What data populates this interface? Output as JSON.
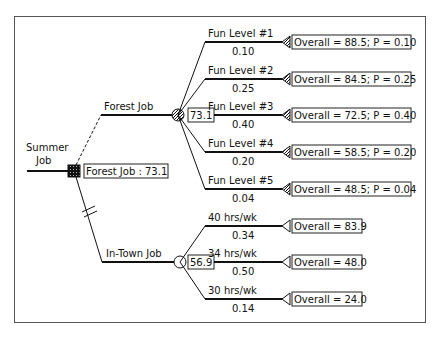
{
  "root": {
    "label_line1": "Summer",
    "label_line2": "Job",
    "value_label": "Forest Job : 73.1"
  },
  "decision_branches": [
    {
      "label": "Forest Job",
      "node_value": "73.1",
      "node_type": "chance"
    },
    {
      "label": "In-Town Job",
      "node_value": "56.9",
      "node_type": "chance"
    }
  ],
  "forest_outcomes": [
    {
      "label": "Fun Level #1",
      "prob": "0.10",
      "result": "Overall = 88.5; P = 0.10"
    },
    {
      "label": "Fun Level #2",
      "prob": "0.25",
      "result": "Overall = 84.5; P = 0.25"
    },
    {
      "label": "Fun Level #3",
      "prob": "0.40",
      "result": "Overall = 72.5; P = 0.40"
    },
    {
      "label": "Fun Level #4",
      "prob": "0.20",
      "result": "Overall = 58.5; P = 0.20"
    },
    {
      "label": "Fun Level #5",
      "prob": "0.04",
      "result": "Overall = 48.5; P = 0.04"
    }
  ],
  "intown_outcomes": [
    {
      "label": "40 hrs/wk",
      "prob": "0.34",
      "result": "Overall = 83.9"
    },
    {
      "label": "34 hrs/wk",
      "prob": "0.50",
      "result": "Overall = 48.0"
    },
    {
      "label": "30 hrs/wk",
      "prob": "0.14",
      "result": "Overall = 24.0"
    }
  ],
  "colors": {
    "line": "#111111",
    "frame": "#555555",
    "background": "#ffffff"
  }
}
